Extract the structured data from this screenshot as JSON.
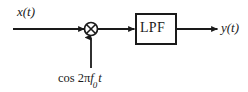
{
  "diagram": {
    "background_color": "#ffffff",
    "stroke_color": "#1a1a1a",
    "canvas": {
      "width": 248,
      "height": 92
    },
    "input": {
      "label": "x(t)",
      "line_y": 29,
      "x_start": 13,
      "x_end": 85
    },
    "multiplier": {
      "symbol": "circle-times",
      "center_x": 91,
      "center_y": 29,
      "radius": 6.5
    },
    "carrier": {
      "full_label": "cos 2πf₀t",
      "function": "cos",
      "factor": "2",
      "greek": "π",
      "frequency_var": "f",
      "frequency_subscript": "0",
      "time_var": "t",
      "line_x": 91,
      "line_y_bottom": 68
    },
    "filter": {
      "label": "LPF",
      "box": {
        "x": 136,
        "y": 14,
        "width": 40,
        "height": 30
      },
      "border_width": 2
    },
    "output": {
      "label": "y(t)",
      "x_start": 176,
      "x_end": 218
    },
    "arrowheads": [
      {
        "name": "into-multiplier",
        "x": 85,
        "y": 29,
        "direction": "right"
      },
      {
        "name": "into-filter",
        "x": 135,
        "y": 29,
        "direction": "right"
      },
      {
        "name": "into-output",
        "x": 216,
        "y": 29,
        "direction": "right"
      },
      {
        "name": "into-multiplier-from-carrier",
        "x": 91,
        "y": 37,
        "direction": "up"
      }
    ]
  }
}
